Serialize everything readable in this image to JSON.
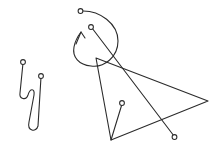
{
  "canvas": {
    "width": 221,
    "height": 151,
    "background_color": "#ffffff",
    "stroke_color": "#2b2b2b",
    "marker_fill_color": "#ffffff",
    "title": "Hand-drawn line sketch",
    "stroke_width": 1.1
  },
  "shapes": {
    "squiggle": {
      "name": "zigzag-squiggle",
      "description": "Looping zigzag stroke on the left side",
      "path": "M 23 63 L 20 93 C 19 99 26 101 28 95 C 30 88 35 88 34 95 L 29 122 C 27 131 36 133 38 126 L 41 77",
      "endpoint_markers": [
        {
          "cx": 23,
          "cy": 62,
          "r": 2.4
        },
        {
          "cx": 41,
          "cy": 76,
          "r": 2.4
        }
      ]
    },
    "arc": {
      "name": "curved-arrow-arc",
      "description": "Near-circular counter-clockwise arc with arrowhead at lower left",
      "path": "M 81 11 C 100 10 118 24 118 41 C 118 57 104 68 91 66 C 79 65 72 57 74 47 C 75 41 78 36 81 32",
      "start_marker": {
        "cx": 80.5,
        "cy": 11,
        "r": 2.4
      },
      "arrow_head": {
        "path": "M 76 44 L 81 32 L 85 38"
      }
    },
    "long_diagonal": {
      "name": "long-diagonal-line",
      "description": "Long straight line from upper-left dot to lower-right dot crossing the triangle",
      "path": "M 92 28 L 174 136",
      "endpoint_markers": [
        {
          "cx": 91,
          "cy": 27,
          "r": 2.4
        },
        {
          "cx": 174.5,
          "cy": 137,
          "r": 2.4
        }
      ]
    },
    "triangle": {
      "name": "open-triangle-polyline",
      "description": "Wide open triangle with apex at left, right vertex, and lower-left vertex",
      "path": "M 96 58 L 208 101 L 111 140 L 96 58"
    },
    "short_line": {
      "name": "short-line-with-dot",
      "description": "Short line from a dot down to the triangle lower-left vertex",
      "path": "M 122 104 L 111 140",
      "endpoint_marker": {
        "cx": 122,
        "cy": 103,
        "r": 2.4
      }
    }
  },
  "labels": {
    "figure_caption": ""
  }
}
